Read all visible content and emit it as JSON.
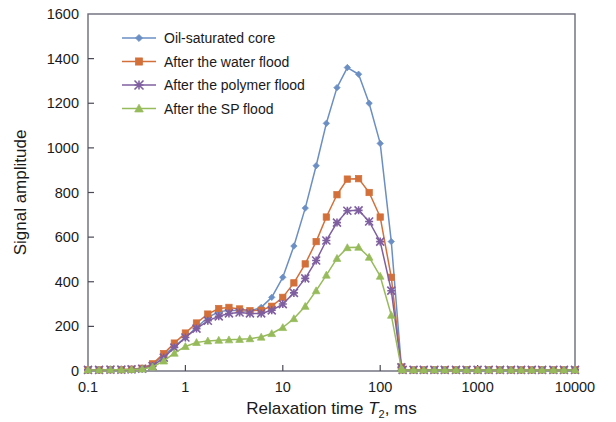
{
  "figure": {
    "background": "#ffffff",
    "plot_border_color": "#6b6b7a"
  },
  "axes": {
    "x": {
      "label_main": "Relaxation time ",
      "label_var": "T",
      "label_sub": "2",
      "label_tail": ", ms",
      "scale": "log",
      "min": 0.1,
      "max": 10000,
      "ticks": [
        "0.1",
        "1",
        "10",
        "100",
        "1000",
        "10000"
      ]
    },
    "y": {
      "label": "Signal amplitude",
      "scale": "linear",
      "min": 0,
      "max": 1600,
      "step": 200,
      "ticks": [
        "0",
        "200",
        "400",
        "600",
        "800",
        "1000",
        "1200",
        "1400",
        "1600"
      ]
    }
  },
  "legend": {
    "position": "top-left-inside",
    "items": [
      {
        "label": "Oil-saturated core",
        "color": "#6b8fc4",
        "marker": "diamond"
      },
      {
        "label": "After the water flood",
        "color": "#d3703a",
        "marker": "square"
      },
      {
        "label": "After the polymer flood",
        "color": "#7f5fa0",
        "marker": "star"
      },
      {
        "label": "After the SP flood",
        "color": "#97bb5b",
        "marker": "triangle"
      }
    ]
  },
  "chart_data": {
    "type": "line",
    "title": "",
    "xlabel": "Relaxation time T2, ms",
    "ylabel": "Signal amplitude",
    "xscale": "log",
    "xlim": [
      0.1,
      10000
    ],
    "ylim": [
      0,
      1600
    ],
    "grid": false,
    "legend_position": "top-left-inside",
    "x": [
      0.1,
      0.13,
      0.17,
      0.22,
      0.28,
      0.36,
      0.46,
      0.6,
      0.77,
      1.0,
      1.3,
      1.7,
      2.2,
      2.8,
      3.6,
      4.6,
      6.0,
      7.7,
      10,
      13,
      17,
      22,
      28,
      36,
      46,
      60,
      77,
      100,
      130,
      165,
      170,
      220,
      280,
      360,
      460,
      600,
      770,
      1000,
      1300,
      1700,
      2200,
      2800,
      3600,
      4600,
      6000,
      7700,
      10000
    ],
    "series": [
      {
        "name": "Oil-saturated core",
        "color": "#6b8fc4",
        "marker": "diamond",
        "values": [
          5,
          5,
          6,
          6,
          8,
          12,
          30,
          70,
          110,
          150,
          195,
          240,
          265,
          272,
          270,
          268,
          285,
          330,
          420,
          560,
          730,
          920,
          1110,
          1270,
          1360,
          1330,
          1200,
          1020,
          580,
          20,
          5,
          5,
          5,
          5,
          5,
          5,
          5,
          5,
          5,
          5,
          5,
          5,
          5,
          5,
          5,
          5,
          5
        ]
      },
      {
        "name": "After the water flood",
        "color": "#d3703a",
        "marker": "square",
        "values": [
          5,
          5,
          6,
          6,
          8,
          12,
          32,
          78,
          125,
          170,
          215,
          255,
          280,
          285,
          278,
          270,
          272,
          290,
          330,
          395,
          480,
          580,
          690,
          790,
          860,
          862,
          800,
          690,
          420,
          18,
          5,
          5,
          5,
          5,
          5,
          5,
          5,
          5,
          5,
          5,
          5,
          5,
          5,
          5,
          5,
          5,
          5
        ]
      },
      {
        "name": "After the polymer flood",
        "color": "#7f5fa0",
        "marker": "star",
        "values": [
          5,
          5,
          6,
          6,
          7,
          10,
          22,
          60,
          105,
          150,
          190,
          225,
          245,
          258,
          262,
          258,
          258,
          272,
          300,
          350,
          415,
          495,
          585,
          665,
          718,
          720,
          670,
          580,
          360,
          16,
          5,
          5,
          5,
          5,
          5,
          5,
          5,
          5,
          5,
          5,
          5,
          5,
          5,
          5,
          5,
          5,
          5
        ]
      },
      {
        "name": "After the SP flood",
        "color": "#97bb5b",
        "marker": "triangle",
        "values": [
          5,
          5,
          6,
          6,
          7,
          9,
          18,
          45,
          80,
          110,
          128,
          135,
          138,
          140,
          142,
          145,
          152,
          168,
          195,
          235,
          290,
          360,
          430,
          505,
          553,
          555,
          510,
          425,
          250,
          12,
          5,
          5,
          5,
          5,
          5,
          5,
          5,
          5,
          5,
          5,
          5,
          5,
          5,
          5,
          5,
          5,
          5
        ]
      }
    ]
  }
}
